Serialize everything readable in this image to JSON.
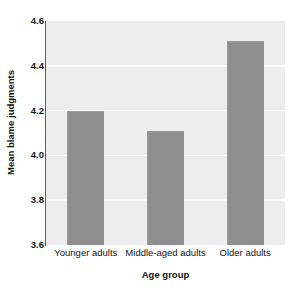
{
  "chart_data": {
    "type": "bar",
    "title": "",
    "categories": [
      "Younger adults",
      "Middle-aged adults",
      "Older adults"
    ],
    "values": [
      4.2,
      4.11,
      4.51
    ],
    "xlabel": "Age group",
    "ylabel": "Mean blame judgments",
    "ylim": [
      3.6,
      4.6
    ],
    "yticks": [
      "4.6",
      "4.4",
      "4.2",
      "4.0",
      "3.8",
      "3.6"
    ],
    "ytick_values": [
      4.6,
      4.4,
      4.2,
      4.0,
      3.8,
      3.6
    ],
    "grid": true,
    "legend": false,
    "colors": {
      "bar_fill": "#8f8f8f",
      "plot_background": "#ededed",
      "gridline": "#fdfdfd",
      "axis": "#5e5e5e",
      "text": "#141414",
      "figure_background": "#ffffff"
    }
  }
}
